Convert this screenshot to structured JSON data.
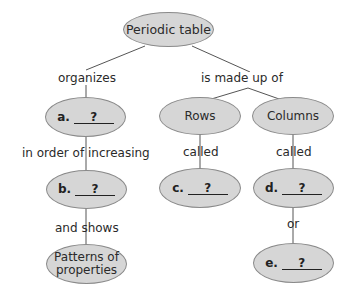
{
  "diagram": {
    "type": "concept-map",
    "root": {
      "id": "periodic-table",
      "label": "Periodic table"
    },
    "nodes": {
      "a": {
        "letter": "a.",
        "answer": "?"
      },
      "b": {
        "letter": "b.",
        "answer": "?"
      },
      "patterns": {
        "line1": "Patterns of",
        "line2": "properties"
      },
      "rows": {
        "label": "Rows"
      },
      "columns": {
        "label": "Columns"
      },
      "c": {
        "letter": "c.",
        "answer": "?"
      },
      "d": {
        "letter": "d.",
        "answer": "?"
      },
      "e": {
        "letter": "e.",
        "answer": "?"
      }
    },
    "links": {
      "organizes": "organizes",
      "is_made_up_of": "is made up of",
      "in_order_of_increasing": "in order of increasing",
      "and_shows": "and shows",
      "rows_called": "called",
      "columns_called": "called",
      "or": "or"
    },
    "colors": {
      "node_fill": "#d6d6d6",
      "node_stroke": "#8a8a8a",
      "line": "#555555",
      "text": "#2a2a2a"
    }
  }
}
